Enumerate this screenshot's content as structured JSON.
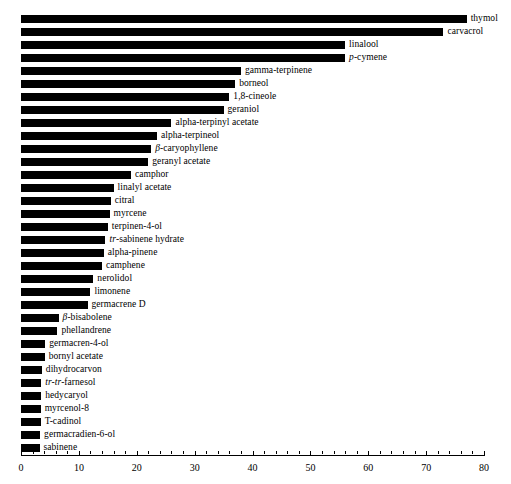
{
  "chart_data": {
    "type": "bar",
    "orientation": "horizontal",
    "title": "",
    "xlabel": "",
    "ylabel": "",
    "xlim": [
      0,
      80
    ],
    "grid": false,
    "legend": null,
    "bar_color": "#000000",
    "axis_ticks": [
      0,
      10,
      20,
      30,
      40,
      50,
      60,
      70,
      80
    ],
    "axis_tick_labels": [
      "0",
      "10",
      "20",
      "30",
      "40",
      "50",
      "60",
      "70",
      "80"
    ],
    "minor_tick_step": 2,
    "categories": [
      "thymol",
      "carvacrol",
      "linalool",
      "p-cymene",
      "gamma-terpinene",
      "borneol",
      "1,8-cineole",
      "geraniol",
      "alpha-terpinyl acetate",
      "alpha-terpineol",
      "β-caryophyllene",
      "geranyl acetate",
      "camphor",
      "linalyl acetate",
      "citral",
      "myrcene",
      "terpinen-4-ol",
      "tr-sabinene hydrate",
      "alpha-pinene",
      "camphene",
      "nerolidol",
      "limonene",
      "germacrene D",
      "β-bisabolene",
      "phellandrene",
      "germacren-4-ol",
      "bornyl acetate",
      "dihydrocarvon",
      "tr-tr-farnesol",
      "hedycaryol",
      "myrcenol-8",
      "T-cadinol",
      "germacradien-6-ol",
      "sabinene"
    ],
    "values": [
      77,
      73,
      56,
      56,
      38,
      37,
      36,
      35,
      26,
      23.5,
      22.5,
      22,
      19,
      16,
      15.5,
      15.3,
      15,
      14.6,
      14.3,
      14,
      12.5,
      12,
      11.5,
      6.5,
      6.3,
      4.2,
      4.1,
      3.6,
      3.5,
      3.5,
      3.4,
      3.4,
      3.3,
      3.2
    ],
    "labels_rich": [
      {
        "pre": "",
        "pre_italic": "",
        "text": "thymol"
      },
      {
        "pre": "",
        "pre_italic": "",
        "text": "carvacrol"
      },
      {
        "pre": "",
        "pre_italic": "",
        "text": "linalool"
      },
      {
        "pre": "",
        "pre_italic": "p",
        "text": "-cymene"
      },
      {
        "pre": "",
        "pre_italic": "",
        "text": "gamma-terpinene"
      },
      {
        "pre": "",
        "pre_italic": "",
        "text": "borneol"
      },
      {
        "pre": "",
        "pre_italic": "",
        "text": "1,8-cineole"
      },
      {
        "pre": "",
        "pre_italic": "",
        "text": "geraniol"
      },
      {
        "pre": "",
        "pre_italic": "",
        "text": "alpha-terpinyl acetate"
      },
      {
        "pre": "",
        "pre_italic": "",
        "text": "alpha-terpineol"
      },
      {
        "pre": "",
        "pre_italic": "β",
        "text": "-caryophyllene"
      },
      {
        "pre": "",
        "pre_italic": "",
        "text": "geranyl acetate"
      },
      {
        "pre": "",
        "pre_italic": "",
        "text": "camphor"
      },
      {
        "pre": "",
        "pre_italic": "",
        "text": "linalyl acetate"
      },
      {
        "pre": "",
        "pre_italic": "",
        "text": "citral"
      },
      {
        "pre": "",
        "pre_italic": "",
        "text": "myrcene"
      },
      {
        "pre": "",
        "pre_italic": "",
        "text": "terpinen-4-ol"
      },
      {
        "pre": "",
        "pre_italic": "tr",
        "text": "-sabinene hydrate"
      },
      {
        "pre": "",
        "pre_italic": "",
        "text": "alpha-pinene"
      },
      {
        "pre": "",
        "pre_italic": "",
        "text": "camphene"
      },
      {
        "pre": "",
        "pre_italic": "",
        "text": "nerolidol"
      },
      {
        "pre": "",
        "pre_italic": "",
        "text": "limonene"
      },
      {
        "pre": "",
        "pre_italic": "",
        "text": "germacrene D"
      },
      {
        "pre": "",
        "pre_italic": "β",
        "text": "-bisabolene"
      },
      {
        "pre": "",
        "pre_italic": "",
        "text": "phellandrene"
      },
      {
        "pre": "",
        "pre_italic": "",
        "text": "germacren-4-ol"
      },
      {
        "pre": "",
        "pre_italic": "",
        "text": "bornyl acetate"
      },
      {
        "pre": "",
        "pre_italic": "",
        "text": "dihydrocarvon"
      },
      {
        "pre": "",
        "pre_italic": "tr-tr",
        "text": "-farnesol"
      },
      {
        "pre": "",
        "pre_italic": "",
        "text": "hedycaryol"
      },
      {
        "pre": "",
        "pre_italic": "",
        "text": "myrcenol-8"
      },
      {
        "pre": "",
        "pre_italic": "",
        "text": "T-cadinol"
      },
      {
        "pre": "",
        "pre_italic": "",
        "text": "germacradien-6-ol"
      },
      {
        "pre": "",
        "pre_italic": "",
        "text": "sabinene"
      }
    ]
  },
  "layout": {
    "origin_x_px": 21,
    "px_per_unit": 5.7875,
    "first_bar_top_px": 14,
    "row_pitch_px": 13,
    "bar_height_px": 8
  }
}
